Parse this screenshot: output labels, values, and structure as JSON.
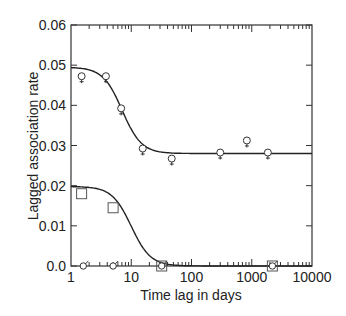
{
  "chart_data": {
    "type": "scatter",
    "title": "",
    "xlabel": "Time lag in days",
    "ylabel": "Lagged association rate",
    "xscale": "log",
    "xlim": [
      1,
      10000
    ],
    "ylim": [
      0,
      0.06
    ],
    "xticks": [
      "1",
      "10",
      "100",
      "1000",
      "10000"
    ],
    "yticks": [
      "0.0",
      "0.01",
      "0.02",
      "0.03",
      "0.04",
      "0.05",
      "0.06"
    ],
    "grid": false,
    "legend": "none",
    "series": [
      {
        "name": "female",
        "marker": "female-symbol",
        "x": [
          1.5,
          3.8,
          6.8,
          15.5,
          47,
          300,
          830,
          1850
        ],
        "y": [
          0.047,
          0.047,
          0.039,
          0.029,
          0.0265,
          0.028,
          0.031,
          0.028
        ]
      },
      {
        "name": "square",
        "marker": "square",
        "x": [
          1.5,
          5,
          32,
          2200
        ],
        "y": [
          0.018,
          0.0145,
          0.0,
          0.0
        ]
      },
      {
        "name": "male",
        "marker": "male-symbol",
        "x": [
          1.6,
          5,
          32,
          2200
        ],
        "y": [
          0.0,
          0.0,
          0.0,
          0.0
        ]
      }
    ],
    "fits": [
      {
        "name": "upper-fit",
        "asymptote": 0.028,
        "start": 0.048
      },
      {
        "name": "lower-fit",
        "asymptote": 0.0,
        "start": 0.019
      }
    ]
  }
}
